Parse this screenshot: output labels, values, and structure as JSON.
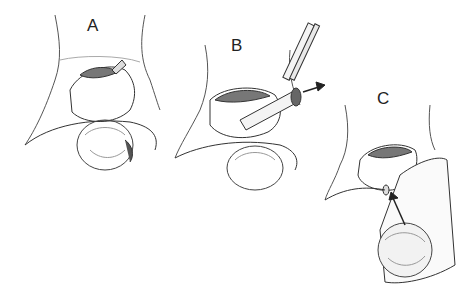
{
  "figure": {
    "panels": [
      {
        "label": "A",
        "x": 87,
        "y": 16
      },
      {
        "label": "B",
        "x": 231,
        "y": 36
      },
      {
        "label": "C",
        "x": 377,
        "y": 89
      }
    ],
    "colors": {
      "ink": "#333333",
      "shade": "#888888",
      "background": "#ffffff"
    }
  }
}
